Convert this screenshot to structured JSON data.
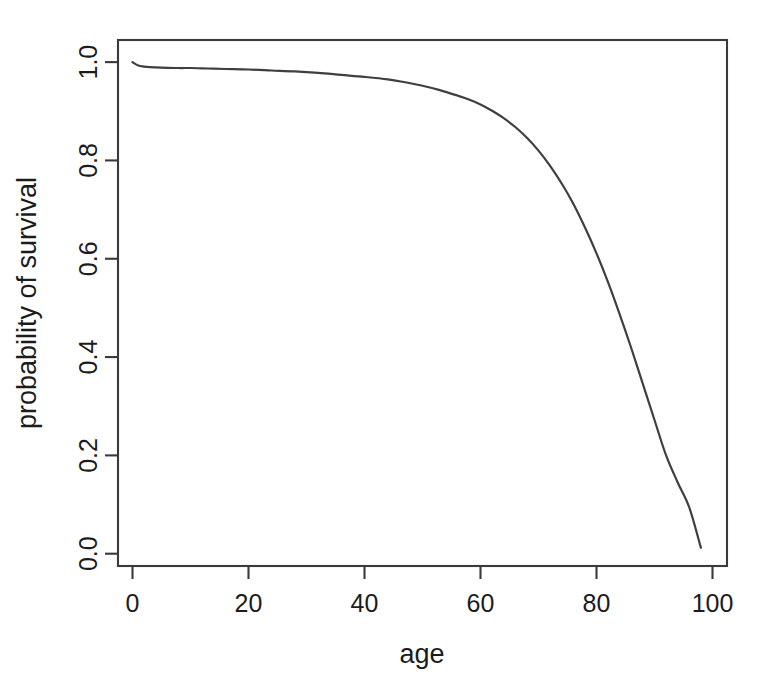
{
  "figure": {
    "background_color": "#ffffff",
    "line_color": "#3f3f3f",
    "axis_color": "#3a3a3a"
  },
  "chart_data": {
    "type": "line",
    "title": "",
    "subtitle": "",
    "xlabel": "age",
    "ylabel": "probability of survival",
    "xlim": [
      -2.5,
      102.5
    ],
    "ylim": [
      -0.025,
      1.045
    ],
    "xticks": [
      0,
      20,
      40,
      60,
      80,
      100
    ],
    "xtick_labels": [
      "0",
      "20",
      "40",
      "60",
      "80",
      "100"
    ],
    "yticks": [
      0.0,
      0.2,
      0.4,
      0.6,
      0.8,
      1.0
    ],
    "ytick_labels": [
      "0.0",
      "0.2",
      "0.4",
      "0.6",
      "0.8",
      "1.0"
    ],
    "grid": false,
    "legend": null,
    "legend_position": "none",
    "annotations": [],
    "series": [
      {
        "name": "probability of survival",
        "color": "#3f3f3f",
        "x": [
          0,
          1,
          2,
          3,
          5,
          8,
          10,
          13,
          16,
          20,
          24,
          28,
          32,
          36,
          40,
          44,
          47,
          50,
          53,
          56,
          58,
          60,
          62,
          64,
          66,
          68,
          70,
          72,
          74,
          76,
          78,
          80,
          82,
          84,
          86,
          88,
          90,
          92,
          94,
          96,
          98
        ],
        "y": [
          1.0,
          0.993,
          0.991,
          0.99,
          0.989,
          0.988,
          0.988,
          0.987,
          0.986,
          0.985,
          0.983,
          0.981,
          0.978,
          0.974,
          0.97,
          0.965,
          0.959,
          0.952,
          0.943,
          0.932,
          0.924,
          0.914,
          0.901,
          0.886,
          0.868,
          0.846,
          0.82,
          0.789,
          0.753,
          0.712,
          0.664,
          0.611,
          0.552,
          0.487,
          0.418,
          0.345,
          0.272,
          0.2,
          0.145,
          0.094,
          0.012
        ]
      }
    ]
  },
  "axes": {
    "x_axis_name": "age-axis",
    "y_axis_name": "probability-of-survival-axis"
  }
}
